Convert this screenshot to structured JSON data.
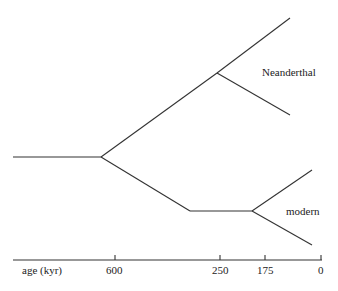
{
  "diagram": {
    "type": "phylogenetic-tree",
    "labels": {
      "neanderthal": "Neanderthal",
      "modern": "modern"
    },
    "axis": {
      "title": "age (kyr)",
      "ticks": [
        "600",
        "250",
        "175",
        "0"
      ]
    }
  }
}
